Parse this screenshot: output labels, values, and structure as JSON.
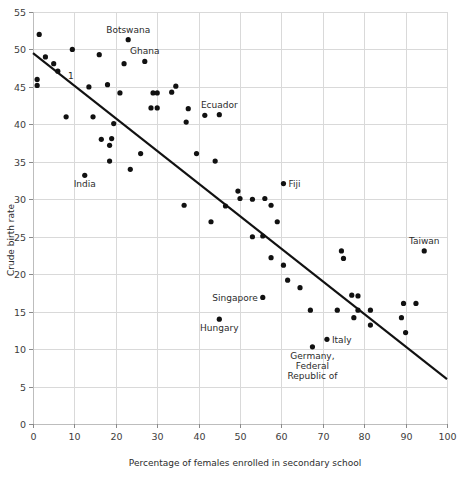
{
  "chart_data": {
    "type": "scatter",
    "title": "",
    "xlabel": "Percentage of females enrolled in secondary school",
    "ylabel": "Crude birth rate",
    "xlim": [
      0,
      100
    ],
    "ylim": [
      0,
      55
    ],
    "grid": true,
    "legend": "none",
    "xticks": [
      0,
      10,
      20,
      30,
      40,
      50,
      60,
      70,
      80,
      90,
      100
    ],
    "xtick_labels": [
      "0",
      "10",
      "20",
      "30",
      "40",
      "50",
      "60",
      "70",
      "80",
      "90",
      "100"
    ],
    "yticks": [
      0,
      5,
      10,
      15,
      20,
      25,
      30,
      35,
      40,
      45,
      50,
      55
    ],
    "ytick_labels": [
      "0",
      "5",
      "10",
      "15",
      "20",
      "25",
      "30",
      "35",
      "40",
      "45",
      "50",
      "55"
    ],
    "point_radius": 2.6,
    "points": [
      {
        "x": 1.5,
        "y": 52.0
      },
      {
        "x": 1.0,
        "y": 46.0
      },
      {
        "x": 1.0,
        "y": 45.2
      },
      {
        "x": 3.0,
        "y": 49.0
      },
      {
        "x": 5.0,
        "y": 48.1
      },
      {
        "x": 6.0,
        "y": 47.1
      },
      {
        "x": 9.5,
        "y": 50.0
      },
      {
        "x": 16.0,
        "y": 49.3
      },
      {
        "x": 22.0,
        "y": 48.1
      },
      {
        "x": 8.0,
        "y": 41.0
      },
      {
        "x": 14.5,
        "y": 41.0
      },
      {
        "x": 13.5,
        "y": 45.0
      },
      {
        "x": 18.0,
        "y": 45.3
      },
      {
        "x": 21.0,
        "y": 44.2
      },
      {
        "x": 16.5,
        "y": 38.0
      },
      {
        "x": 19.0,
        "y": 38.1
      },
      {
        "x": 18.5,
        "y": 37.2
      },
      {
        "x": 19.5,
        "y": 40.1
      },
      {
        "x": 18.5,
        "y": 35.1
      },
      {
        "x": 23.5,
        "y": 34.0
      },
      {
        "x": 26.0,
        "y": 36.1
      },
      {
        "x": 29.0,
        "y": 44.2
      },
      {
        "x": 30.0,
        "y": 44.2
      },
      {
        "x": 28.5,
        "y": 42.2
      },
      {
        "x": 30.0,
        "y": 42.2
      },
      {
        "x": 34.5,
        "y": 45.1
      },
      {
        "x": 33.5,
        "y": 44.3
      },
      {
        "x": 37.5,
        "y": 42.1
      },
      {
        "x": 37.0,
        "y": 40.3
      },
      {
        "x": 41.5,
        "y": 41.2
      },
      {
        "x": 39.5,
        "y": 36.1
      },
      {
        "x": 44.0,
        "y": 35.1
      },
      {
        "x": 46.5,
        "y": 29.1
      },
      {
        "x": 49.5,
        "y": 31.1
      },
      {
        "x": 36.5,
        "y": 29.2
      },
      {
        "x": 43.0,
        "y": 27.0
      },
      {
        "x": 50.0,
        "y": 30.1
      },
      {
        "x": 53.0,
        "y": 30.0
      },
      {
        "x": 56.0,
        "y": 30.1
      },
      {
        "x": 57.5,
        "y": 29.2
      },
      {
        "x": 59.0,
        "y": 27.0
      },
      {
        "x": 53.0,
        "y": 25.0
      },
      {
        "x": 55.5,
        "y": 25.1
      },
      {
        "x": 57.5,
        "y": 22.2
      },
      {
        "x": 60.5,
        "y": 21.2
      },
      {
        "x": 61.5,
        "y": 19.2
      },
      {
        "x": 64.5,
        "y": 18.2
      },
      {
        "x": 67.0,
        "y": 15.2
      },
      {
        "x": 73.5,
        "y": 15.2
      },
      {
        "x": 74.5,
        "y": 23.1
      },
      {
        "x": 75.0,
        "y": 22.1
      },
      {
        "x": 77.0,
        "y": 17.2
      },
      {
        "x": 78.5,
        "y": 17.1
      },
      {
        "x": 77.5,
        "y": 14.2
      },
      {
        "x": 78.5,
        "y": 15.2
      },
      {
        "x": 81.5,
        "y": 15.2
      },
      {
        "x": 81.5,
        "y": 13.2
      },
      {
        "x": 89.5,
        "y": 16.1
      },
      {
        "x": 92.5,
        "y": 16.1
      },
      {
        "x": 89.0,
        "y": 14.2
      },
      {
        "x": 90.0,
        "y": 12.2
      }
    ],
    "labeled_points": [
      {
        "label": "Botswana",
        "x": 23.0,
        "y": 51.3,
        "label_dx": 0,
        "label_dy": -7,
        "anchor": "middle"
      },
      {
        "label": "Ghana",
        "x": 27.0,
        "y": 48.4,
        "label_dx": 0,
        "label_dy": -7,
        "anchor": "middle"
      },
      {
        "label": "Ecuador",
        "x": 45.0,
        "y": 41.3,
        "label_dx": 0,
        "label_dy": -7,
        "anchor": "middle"
      },
      {
        "label": "India",
        "x": 12.5,
        "y": 33.2,
        "label_dx": 0,
        "label_dy": 12,
        "anchor": "middle"
      },
      {
        "label": "Fiji",
        "x": 60.5,
        "y": 32.1,
        "label_dx": 5,
        "label_dy": 3.5,
        "anchor": "start"
      },
      {
        "label": "Taiwan",
        "x": 94.5,
        "y": 23.1,
        "label_dx": 0,
        "label_dy": -7,
        "anchor": "middle"
      },
      {
        "label": "Singapore",
        "x": 55.5,
        "y": 16.9,
        "label_dx": -5,
        "label_dy": 3.5,
        "anchor": "end"
      },
      {
        "label": "Hungary",
        "x": 45.0,
        "y": 14.0,
        "label_dx": 0,
        "label_dy": 12,
        "anchor": "middle"
      },
      {
        "label": "Italy",
        "x": 71.0,
        "y": 11.3,
        "label_dx": 5,
        "label_dy": 3.5,
        "anchor": "start"
      }
    ],
    "multiline_labels": [
      {
        "lines": [
          "Germany,",
          "Federal",
          "Republic of"
        ],
        "x": 67.5,
        "y": 10.3,
        "label_dx": 0,
        "label_dy": 12,
        "line_height": 10,
        "anchor": "middle"
      }
    ],
    "annotations": [
      {
        "text": "1",
        "x": 7.5,
        "y": 46.5,
        "label_dx": 4,
        "label_dy": 3,
        "anchor": "start"
      }
    ],
    "trend_line": {
      "x1": 0,
      "y1": 49.5,
      "x2": 100,
      "y2": 6.0
    }
  }
}
